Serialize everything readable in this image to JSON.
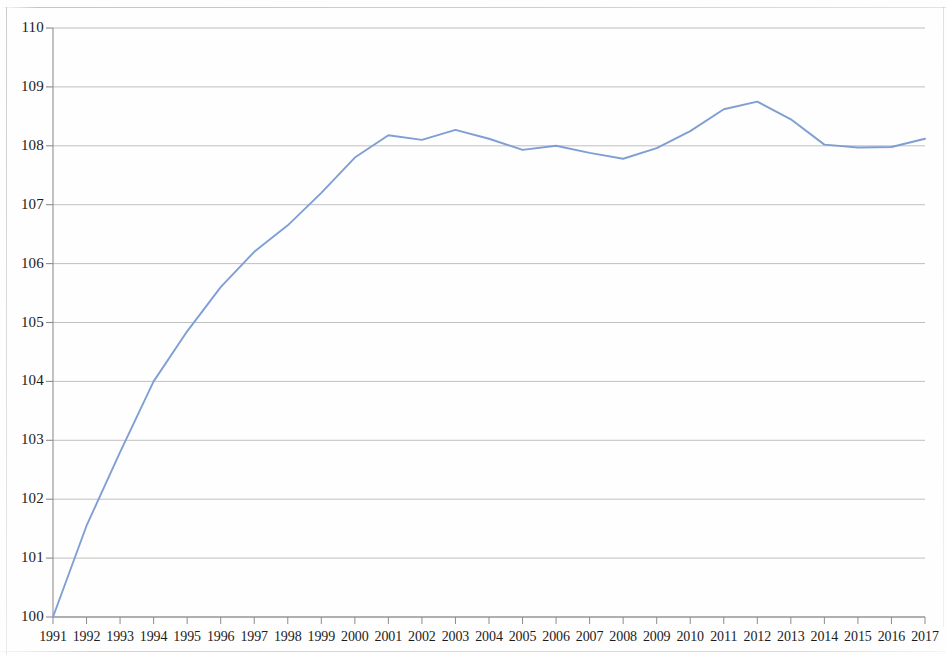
{
  "chart_data": {
    "type": "line",
    "title": "",
    "subtitle": "",
    "xlabel": "",
    "ylabel": "",
    "grid": true,
    "legend": false,
    "legend_position": "none",
    "line_color": "#7f9fd4",
    "grid_color": "#9a9a9a",
    "axis_color": "#8c8c8c",
    "background_color": "#ffffff",
    "xlim": [
      1991,
      2017
    ],
    "ylim": [
      100,
      110
    ],
    "y_tick_step": 1,
    "x_tick_step": 1,
    "categories": [
      "1991",
      "1992",
      "1993",
      "1994",
      "1995",
      "1996",
      "1997",
      "1998",
      "1999",
      "2000",
      "2001",
      "2002",
      "2003",
      "2004",
      "2005",
      "2006",
      "2007",
      "2008",
      "2009",
      "2010",
      "2011",
      "2012",
      "2013",
      "2014",
      "2015",
      "2016",
      "2017"
    ],
    "x": [
      1991,
      1992,
      1993,
      1994,
      1995,
      1996,
      1997,
      1998,
      1999,
      2000,
      2001,
      2002,
      2003,
      2004,
      2005,
      2006,
      2007,
      2008,
      2009,
      2010,
      2011,
      2012,
      2013,
      2014,
      2015,
      2016,
      2017
    ],
    "values": [
      100.0,
      101.55,
      102.8,
      104.0,
      104.85,
      105.6,
      106.2,
      106.65,
      107.2,
      107.8,
      108.18,
      108.1,
      108.27,
      108.12,
      107.93,
      108.0,
      107.88,
      107.78,
      107.96,
      108.25,
      108.62,
      108.75,
      108.45,
      108.02,
      107.97,
      107.98,
      108.12
    ],
    "y_tick_labels": [
      "110",
      "109",
      "108",
      "107",
      "106",
      "105",
      "104",
      "103",
      "102",
      "101",
      "100"
    ],
    "y_tick_values": [
      110,
      109,
      108,
      107,
      106,
      105,
      104,
      103,
      102,
      101,
      100
    ],
    "series": [
      {
        "name": "Index",
        "values": [
          100.0,
          101.55,
          102.8,
          104.0,
          104.85,
          105.6,
          106.2,
          106.65,
          107.2,
          107.8,
          108.18,
          108.1,
          108.27,
          108.12,
          107.93,
          108.0,
          107.88,
          107.78,
          107.96,
          108.25,
          108.62,
          108.75,
          108.45,
          108.02,
          107.97,
          107.98,
          108.12
        ]
      }
    ],
    "annotations": []
  }
}
